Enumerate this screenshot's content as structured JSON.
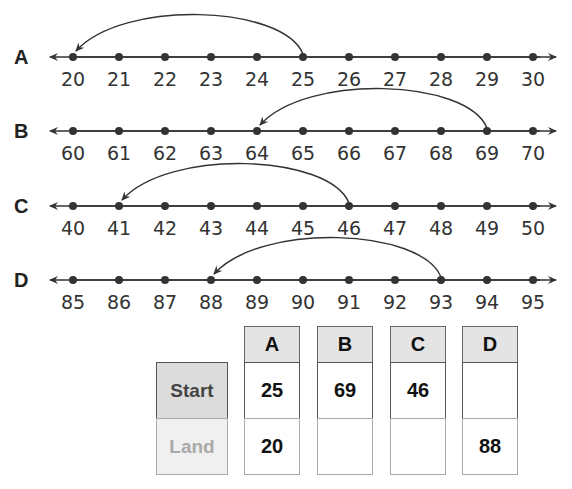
{
  "number_lines": [
    {
      "label": "A",
      "y": 57,
      "ticks": [
        20,
        21,
        22,
        23,
        24,
        25,
        26,
        27,
        28,
        29,
        30
      ],
      "jump": {
        "start": 25,
        "land": 20
      }
    },
    {
      "label": "B",
      "y": 131,
      "ticks": [
        60,
        61,
        62,
        63,
        64,
        65,
        66,
        67,
        68,
        69,
        70
      ],
      "jump": {
        "start": 69,
        "land": 64
      }
    },
    {
      "label": "C",
      "y": 206,
      "ticks": [
        40,
        41,
        42,
        43,
        44,
        45,
        46,
        47,
        48,
        49,
        50
      ],
      "jump": {
        "start": 46,
        "land": 41
      }
    },
    {
      "label": "D",
      "y": 280,
      "ticks": [
        85,
        86,
        87,
        88,
        89,
        90,
        91,
        92,
        93,
        94,
        95
      ],
      "jump": {
        "start": 93,
        "land": 88
      }
    }
  ],
  "table": {
    "row_labels": {
      "start": "Start",
      "land": "Land"
    },
    "columns": [
      {
        "header": "A",
        "start": "25",
        "land": "20"
      },
      {
        "header": "B",
        "start": "69",
        "land": ""
      },
      {
        "header": "C",
        "start": "46",
        "land": ""
      },
      {
        "header": "D",
        "start": "",
        "land": "88"
      }
    ]
  },
  "colors": {
    "line": "#333333",
    "header_fill": "#e4e4e4",
    "start_label_fill": "#dcdcdc",
    "land_label_fill": "#f0f0f0",
    "land_label_text": "#aaaaaa"
  }
}
